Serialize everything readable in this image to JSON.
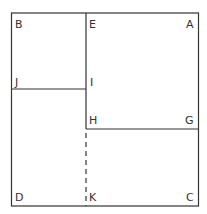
{
  "diagram": {
    "stroke_color": "#333333",
    "labels": {
      "B": "B",
      "E": "E",
      "A": "A",
      "J": "J",
      "I": "I",
      "H": "H",
      "G": "G",
      "D": "D",
      "K": "K",
      "C": "C"
    }
  }
}
